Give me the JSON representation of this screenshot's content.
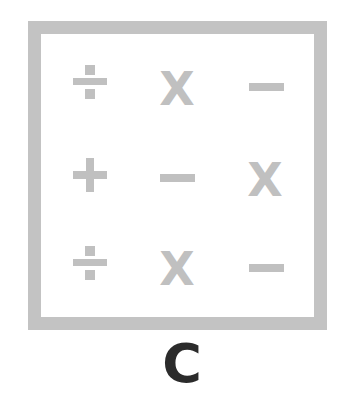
{
  "grid": {
    "rows": [
      [
        "divide",
        "times",
        "minus"
      ],
      [
        "plus",
        "minus",
        "times"
      ],
      [
        "divide",
        "times",
        "minus"
      ]
    ],
    "times_glyph": "X",
    "symbol_color": "#c0c0c0",
    "border_color": "#c3c3c3"
  },
  "label": "C",
  "label_color": "#2b2b2b"
}
